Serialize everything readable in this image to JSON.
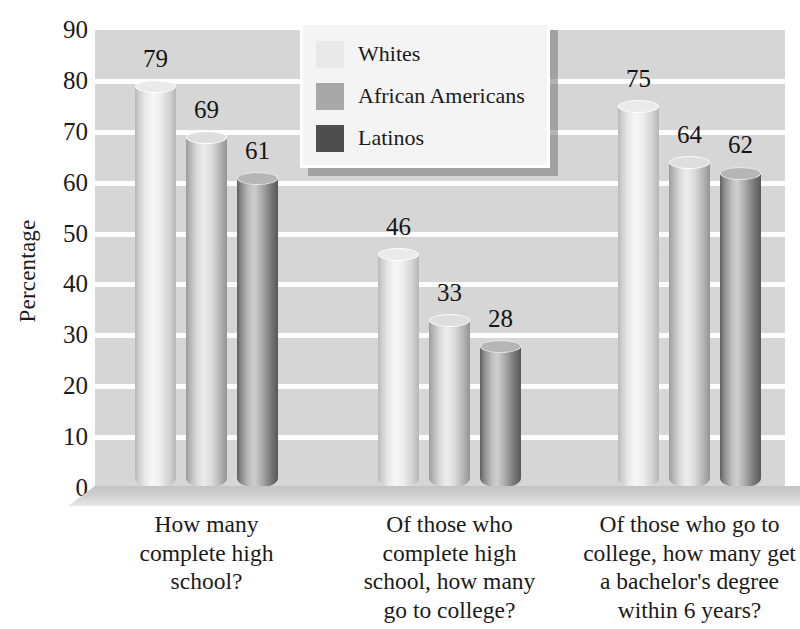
{
  "chart_data": {
    "type": "bar",
    "title": "",
    "subtitle": "",
    "xlabel": "",
    "ylabel": "Percentage",
    "ylim": [
      0,
      90
    ],
    "ytick_step": 10,
    "yticks": [
      90,
      80,
      70,
      60,
      50,
      40,
      30,
      20,
      10,
      0
    ],
    "grid": "horizontal",
    "legend_position": "top-center",
    "value_labels": true,
    "categories": [
      "How many complete high school?",
      "Of those who complete high school, how many go to college?",
      "Of those who go to college, how many get a bachelor's degree within 6 years?"
    ],
    "category_lines": [
      [
        "How many",
        "complete high",
        "school?"
      ],
      [
        "Of those who",
        "complete high",
        "school, how many",
        "go to college?"
      ],
      [
        "Of those who go to",
        "college, how many get",
        "a bachelor's degree",
        "within 6 years?"
      ]
    ],
    "series": [
      {
        "name": "Whites",
        "color": "#e9e9e9",
        "values": [
          79,
          46,
          75
        ]
      },
      {
        "name": "African Americans",
        "color": "#a8a8a8",
        "values": [
          69,
          33,
          64
        ]
      },
      {
        "name": "Latinos",
        "color": "#4e4e4e",
        "values": [
          61,
          28,
          62
        ]
      }
    ]
  },
  "axis": {
    "y_title": "Percentage"
  },
  "legend": {
    "entries": [
      {
        "label": "Whites"
      },
      {
        "label": "African Americans"
      },
      {
        "label": "Latinos"
      }
    ]
  },
  "style": {
    "plot_background": "#d6d6d6",
    "gridline_color": "#fdfdfd",
    "text_color": "#1a1a1a",
    "legend_background": "#f4f4f4"
  }
}
